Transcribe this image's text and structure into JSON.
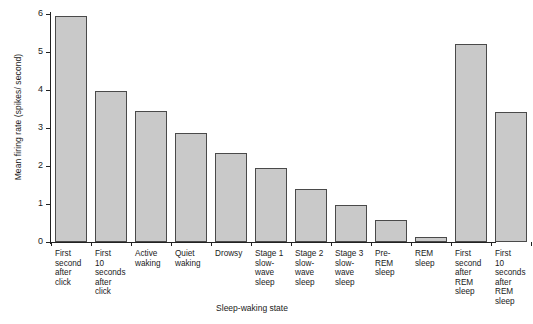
{
  "chart_data": {
    "type": "bar",
    "title": "",
    "xlabel": "Sleep-waking state",
    "ylabel": "Mean firing rate (spikes/ second)",
    "ylim": [
      0,
      6
    ],
    "yticks": [
      "0",
      "1",
      "2",
      "3",
      "4",
      "5",
      "6"
    ],
    "grid": false,
    "legend": "none",
    "bar_color": "#c9c9c9",
    "bar_edge_color": "#4a4a4a",
    "axis_color": "#222222",
    "categories": [
      "First second after click",
      "First 10 seconds after click",
      "Active waking",
      "Quiet waking",
      "Drowsy",
      "Stage 1 slow-wave sleep",
      "Stage 2 slow-wave sleep",
      "Stage 3 slow-wave sleep",
      "Pre-REM sleep",
      "REM sleep",
      "First second after REM sleep",
      "First 10 seconds after REM sleep"
    ],
    "categories_wrapped": [
      [
        "First",
        "second",
        "after",
        "click"
      ],
      [
        "First",
        "10",
        "seconds",
        "after",
        "click"
      ],
      [
        "Active",
        "waking"
      ],
      [
        "Quiet",
        "waking"
      ],
      [
        "Drowsy"
      ],
      [
        "Stage 1",
        "slow-",
        "wave",
        "sleep"
      ],
      [
        "Stage 2",
        "slow-",
        "wave",
        "sleep"
      ],
      [
        "Stage 3",
        "slow-",
        "wave",
        "sleep"
      ],
      [
        "Pre-",
        "REM",
        "sleep"
      ],
      [
        "REM",
        "sleep"
      ],
      [
        "First",
        "second",
        "after",
        "REM",
        "sleep"
      ],
      [
        "First",
        "10",
        "seconds",
        "after",
        "REM",
        "sleep"
      ]
    ],
    "values": [
      5.95,
      3.98,
      3.45,
      2.88,
      2.35,
      1.95,
      1.4,
      0.97,
      0.57,
      0.12,
      5.21,
      3.42
    ]
  }
}
